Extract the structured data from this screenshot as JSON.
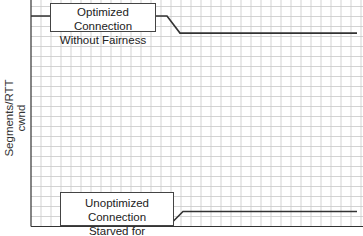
{
  "chart_data": {
    "type": "line",
    "title": "",
    "xlabel": "",
    "ylabel": "Segments/RTT cwnd",
    "ylabel_lines": [
      "Segments/RTT",
      "cwnd"
    ],
    "grid": true,
    "legend": "none",
    "x_range": [
      0,
      33
    ],
    "y_range": [
      0,
      22.6
    ],
    "series": [
      {
        "name": "Optimized Connection Without Fairness",
        "label_lines": [
          "Optimized Connection",
          "Without Fairness"
        ],
        "points": [
          [
            0,
            21.0
          ],
          [
            13.6,
            21.0
          ],
          [
            14.9,
            19.3
          ],
          [
            32.6,
            19.3
          ]
        ]
      },
      {
        "name": "Unoptimized Connection Starved for Bandwidth",
        "label_lines": [
          "Unoptimized Connection",
          "Starved for Bandwidth"
        ],
        "points": [
          [
            13.7,
            0
          ],
          [
            15.2,
            1.5
          ],
          [
            32.6,
            1.5
          ]
        ]
      }
    ],
    "annotations": [
      "Optimized Connection Without Fairness",
      "Unoptimized Connection Starved for Bandwidth"
    ]
  },
  "colors": {
    "grid": "#c8c8c8",
    "axis": "#333333",
    "line": "#333333",
    "background": "#ffffff"
  }
}
